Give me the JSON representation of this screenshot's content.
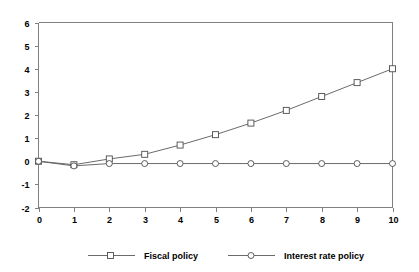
{
  "chart_data": {
    "type": "line",
    "title": "",
    "xlabel": "",
    "ylabel": "",
    "x": [
      0,
      1,
      2,
      3,
      4,
      5,
      6,
      7,
      8,
      9,
      10
    ],
    "xlim": [
      0,
      10
    ],
    "ylim": [
      -2,
      6
    ],
    "xticks": [
      "0",
      "1",
      "2",
      "3",
      "4",
      "5",
      "6",
      "7",
      "8",
      "9",
      "10"
    ],
    "yticks": [
      "6",
      "5",
      "4",
      "3",
      "2",
      "1",
      "0",
      "-1",
      "-2"
    ],
    "ytick_values": [
      6,
      5,
      4,
      3,
      2,
      1,
      0,
      -1,
      -2
    ],
    "grid": false,
    "legend_position": "bottom",
    "series": [
      {
        "name": "Fiscal policy",
        "marker": "square",
        "color": "#595959",
        "values": [
          0,
          -0.15,
          0.1,
          0.3,
          0.7,
          1.15,
          1.65,
          2.2,
          2.8,
          3.4,
          4.0
        ]
      },
      {
        "name": "Interest rate policy",
        "marker": "circle",
        "color": "#595959",
        "values": [
          0,
          -0.2,
          -0.1,
          -0.1,
          -0.1,
          -0.1,
          -0.1,
          -0.1,
          -0.1,
          -0.1,
          -0.1
        ]
      }
    ]
  },
  "legend": {
    "items": [
      {
        "label": "Fiscal policy",
        "marker": "square"
      },
      {
        "label": "Interest rate policy",
        "marker": "circle"
      }
    ]
  },
  "colors": {
    "axis": "#808080",
    "line": "#595959",
    "marker_stroke": "#4d4d4d",
    "background": "#ffffff",
    "text": "#000000"
  }
}
